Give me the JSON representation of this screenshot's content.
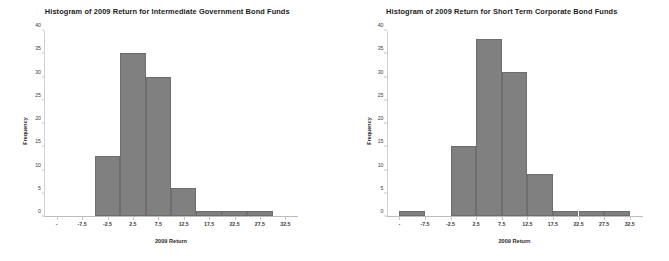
{
  "chart_data": [
    {
      "type": "bar",
      "title": "Histogram of 2009 Return for Intermediate Government Bond Funds",
      "xlabel": "2009 Return",
      "ylabel": "Frequency",
      "xlim": [
        -15,
        35
      ],
      "ylim": [
        0,
        40
      ],
      "yticks": [
        0,
        5,
        10,
        15,
        20,
        25,
        30,
        35,
        40
      ],
      "ytick_labels": [
        "0",
        "5",
        "10",
        "15",
        "20",
        "25",
        "30",
        "35",
        "40"
      ],
      "xticks": [
        -12.5,
        -7.5,
        -2.5,
        2.5,
        7.5,
        12.5,
        17.5,
        22.5,
        27.5,
        32.5
      ],
      "xtick_labels": [
        "-",
        "-7.5",
        "-2.5",
        "2.5",
        "7.5",
        "12.5",
        "17.5",
        "22.5",
        "27.5",
        "32.5"
      ],
      "grid": false,
      "legend": false,
      "bin_width": 5,
      "bins": [
        {
          "left": -5.0,
          "right": 0.0,
          "value": 13
        },
        {
          "left": 0.0,
          "right": 5.0,
          "value": 35
        },
        {
          "left": 5.0,
          "right": 10.0,
          "value": 30
        },
        {
          "left": 10.0,
          "right": 15.0,
          "value": 6
        },
        {
          "left": 15.0,
          "right": 20.0,
          "value": 1
        },
        {
          "left": 20.0,
          "right": 25.0,
          "value": 1
        },
        {
          "left": 25.0,
          "right": 30.0,
          "value": 1
        }
      ],
      "bar_color": "#808080",
      "bar_edge_color": "#6d6d6d"
    },
    {
      "type": "bar",
      "title": "Histogram of 2009 Return for Short Term Corporate Bond Funds",
      "xlabel": "2009 Return",
      "ylabel": "Frequency",
      "xlim": [
        -15,
        35
      ],
      "ylim": [
        0,
        40
      ],
      "yticks": [
        0,
        5,
        10,
        15,
        20,
        25,
        30,
        35,
        40
      ],
      "ytick_labels": [
        "0",
        "5",
        "10",
        "15",
        "20",
        "25",
        "30",
        "35",
        "40"
      ],
      "xticks": [
        -12.5,
        -7.5,
        -2.5,
        2.5,
        7.5,
        12.5,
        17.5,
        22.5,
        27.5,
        32.5
      ],
      "xtick_labels": [
        "-",
        "-7.5",
        "-2.5",
        "2.5",
        "7.5",
        "12.5",
        "17.5",
        "22.5",
        "27.5",
        "32.5"
      ],
      "grid": false,
      "legend": false,
      "bin_width": 5,
      "bins": [
        {
          "left": -12.5,
          "right": -7.5,
          "value": 1
        },
        {
          "left": -2.5,
          "right": 2.5,
          "value": 15
        },
        {
          "left": 2.5,
          "right": 7.5,
          "value": 38
        },
        {
          "left": 7.5,
          "right": 12.5,
          "value": 31
        },
        {
          "left": 12.5,
          "right": 17.5,
          "value": 9
        },
        {
          "left": 17.5,
          "right": 22.5,
          "value": 1
        },
        {
          "left": 22.5,
          "right": 27.5,
          "value": 1
        },
        {
          "left": 27.5,
          "right": 32.5,
          "value": 1
        }
      ],
      "bar_color": "#808080",
      "bar_edge_color": "#6d6d6d"
    }
  ]
}
